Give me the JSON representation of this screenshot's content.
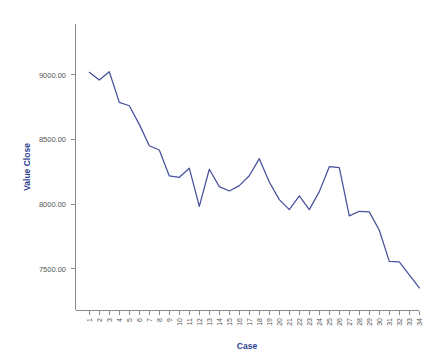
{
  "chart_data": {
    "type": "line",
    "title": "",
    "xlabel": "Case",
    "ylabel": "Value Close",
    "x": [
      1,
      2,
      3,
      4,
      5,
      6,
      7,
      8,
      9,
      10,
      11,
      12,
      13,
      14,
      15,
      16,
      17,
      18,
      19,
      20,
      21,
      22,
      23,
      24,
      25,
      26,
      27,
      28,
      29,
      30,
      31,
      32,
      33,
      34
    ],
    "categories": [
      "1",
      "2",
      "3",
      "4",
      "5",
      "6",
      "7",
      "8",
      "9",
      "10",
      "11",
      "12",
      "13",
      "14",
      "15",
      "16",
      "17",
      "18",
      "19",
      "20",
      "21",
      "22",
      "23",
      "24",
      "25",
      "26",
      "27",
      "28",
      "29",
      "30",
      "31",
      "32",
      "33",
      "34"
    ],
    "values": [
      9018,
      8959,
      9023,
      8786,
      8760,
      8616,
      8451,
      8418,
      8217,
      8207,
      8277,
      7982,
      8269,
      8135,
      8101,
      8142,
      8219,
      8351,
      8170,
      8034,
      7957,
      8064,
      7957,
      8096,
      8289,
      8282,
      7908,
      7944,
      7939,
      7797,
      7557,
      7552,
      7452,
      7351
    ],
    "series": [
      {
        "name": "Value Close",
        "color": "#46509b",
        "values": [
          9018,
          8959,
          9023,
          8786,
          8760,
          8616,
          8451,
          8418,
          8217,
          8207,
          8277,
          7982,
          8269,
          8135,
          8101,
          8142,
          8219,
          8351,
          8170,
          8034,
          7957,
          8064,
          7957,
          8096,
          8289,
          8282,
          7908,
          7944,
          7939,
          7797,
          7557,
          7552,
          7452,
          7351
        ]
      }
    ],
    "ylim": [
      7200,
      9200
    ],
    "y_ticks": [
      7500,
      8000,
      8500,
      9000
    ],
    "y_tick_labels": [
      "7500.00",
      "8000.00",
      "8500.00",
      "9000.00"
    ],
    "grid": false,
    "legend": "none",
    "axis_color": "#8a8a8a",
    "label_color": "#2c3e8f",
    "tick_label_color": "#555555"
  },
  "axes": {
    "x_title": "Case",
    "y_title": "Value Close"
  }
}
